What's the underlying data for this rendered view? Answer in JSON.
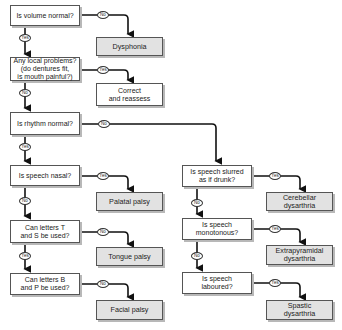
{
  "diagram": {
    "questions": {
      "q1": "Is volume normal?",
      "q2": "Any local problems?\n(do dentures fit,\nis mouth painful?)",
      "q3": "Is rhythm normal?",
      "q4": "Is speech nasal?",
      "q5": "Can letters T\nand S be used?",
      "q6": "Can letters B\nand P be used?",
      "q7": "Is speech slurred\nas if drunk?",
      "q8": "Is speech\nmonotonous?",
      "q9": "Is speech\nlaboured?"
    },
    "outcomes": {
      "o1": "Dysphonia",
      "o2": "Correct\nand reassess",
      "o3": "Palatal palsy",
      "o4": "Tongue palsy",
      "o5": "Facial palsy",
      "o6": "Cerebellar\ndysarthria",
      "o7": "Extrapyramidal\ndysarthria",
      "o8": "Spastic\ndysarthria"
    },
    "labels": {
      "q1_right": "No",
      "q1_down": "Yes",
      "q2_right": "Yes",
      "q2_down": "No",
      "q3_right": "No",
      "q3_down": "Yes",
      "q4_right": "Yes",
      "q4_down": "No",
      "q5_right": "No",
      "q5_down": "Yes",
      "q6_right": "No",
      "q7_right": "Yes",
      "q7_down": "No",
      "q8_right": "Yes",
      "q8_down": "No",
      "q9_right": "Yes"
    },
    "colors": {
      "outcome_fill": "#e2e2e2",
      "question_fill": "#ffffff",
      "line": "#111111"
    }
  }
}
